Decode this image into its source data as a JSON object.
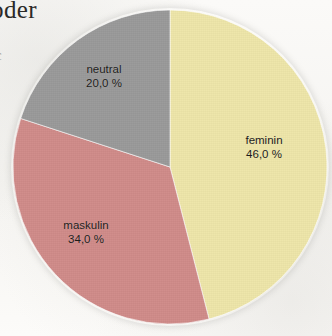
{
  "page": {
    "cut_text_top": "oder",
    "cut_text_margin": "c"
  },
  "chart_data": {
    "type": "pie",
    "title": "",
    "subtitle": "",
    "xlabel": "",
    "ylabel": "",
    "legend_position": "none",
    "grid": false,
    "value_unit": "%",
    "decimal_separator": ",",
    "start_angle_deg": 0,
    "direction": "clockwise",
    "categories": [
      "feminin",
      "maskulin",
      "neutral"
    ],
    "values": [
      46.0,
      34.0,
      20.0
    ],
    "colors": [
      "#EEE6A9",
      "#D08B89",
      "#9A9A9A"
    ],
    "slices": [
      {
        "label": "feminin",
        "value": 46.0,
        "value_text": "46,0 %",
        "color": "#EEE6A9",
        "start_deg": 0,
        "end_deg": 165.6
      },
      {
        "label": "maskulin",
        "value": 34.0,
        "value_text": "34,0 %",
        "color": "#D08B89",
        "start_deg": 165.6,
        "end_deg": 288.0
      },
      {
        "label": "neutral",
        "value": 20.0,
        "value_text": "20,0 %",
        "color": "#9A9A9A",
        "start_deg": 288.0,
        "end_deg": 360.0
      }
    ]
  },
  "labels": {
    "feminin": {
      "name": "feminin",
      "value": "46,0 %"
    },
    "maskulin": {
      "name": "maskulin",
      "value": "34,0 %"
    },
    "neutral": {
      "name": "neutral",
      "value": "20,0 %"
    }
  }
}
